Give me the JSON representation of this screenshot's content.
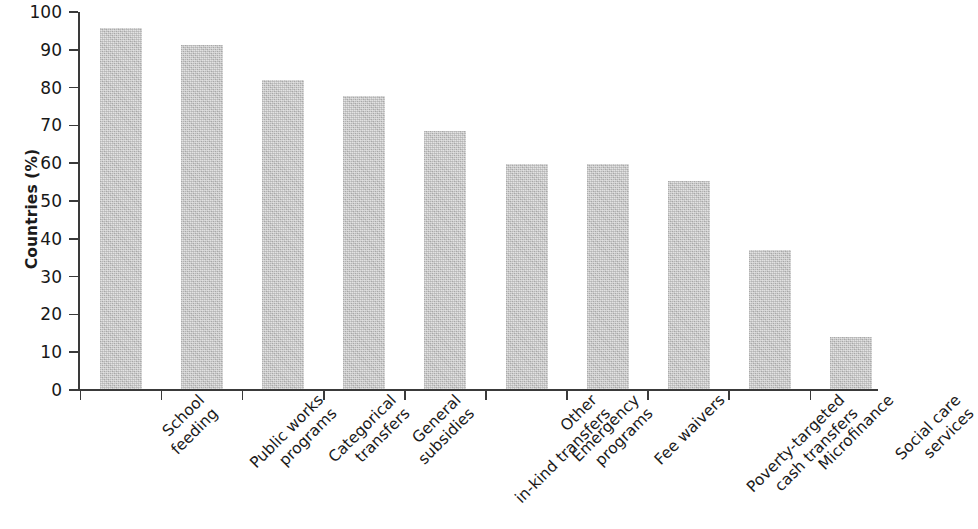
{
  "chart_data": {
    "type": "bar",
    "title": "",
    "xlabel": "",
    "ylabel": "Countries (%)",
    "ylim": [
      0,
      100
    ],
    "ytick_values": [
      0,
      10,
      20,
      30,
      40,
      50,
      60,
      70,
      80,
      90,
      100
    ],
    "ytick_labels": [
      "0",
      "10",
      "20",
      "30",
      "40",
      "50",
      "60",
      "70",
      "80",
      "90",
      "100"
    ],
    "grid": false,
    "legend": null,
    "bar_color": "#c2c2c2",
    "axis_color": "#3a3a3a",
    "categories": [
      "School feeding",
      "Public works programs",
      "Categorical transfers",
      "General subsidies",
      "Other in-kind transfers",
      "Emergency programs",
      "Fee waivers",
      "Poverty-targeted cash transfers",
      "Microfinance",
      "Social care services"
    ],
    "category_lines": [
      [
        "School",
        "feeding"
      ],
      [
        "Public works",
        "programs"
      ],
      [
        "Categorical",
        "transfers"
      ],
      [
        "General",
        "subsidies"
      ],
      [
        "Other",
        "in-kind transfers"
      ],
      [
        "Emergency",
        "programs"
      ],
      [
        "Fee waivers",
        ""
      ],
      [
        "Poverty-targeted",
        "cash transfers"
      ],
      [
        "Microfinance",
        ""
      ],
      [
        "Social care",
        "services"
      ]
    ],
    "values": [
      95.5,
      91.0,
      81.8,
      77.5,
      68.3,
      59.5,
      59.5,
      55.0,
      36.7,
      13.8
    ]
  }
}
